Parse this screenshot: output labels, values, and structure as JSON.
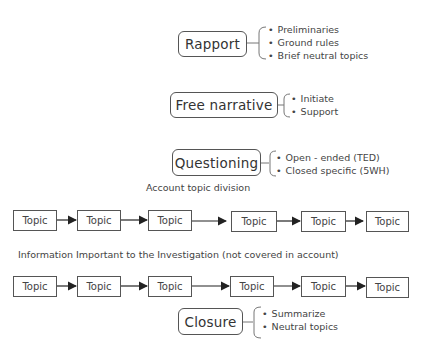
{
  "stages": [
    {
      "label": "Rapport",
      "items": [
        "Preliminaries",
        "Ground rules",
        "Brief neutral topics"
      ]
    },
    {
      "label": "Free narrative",
      "items": [
        "Initiate",
        "Support"
      ]
    },
    {
      "label": "Questioning",
      "items": [
        "Open - ended (TED)",
        "Closed specific (5WH)"
      ]
    },
    {
      "label": "Closure",
      "items": [
        "Summarize",
        "Neutral topics"
      ]
    }
  ],
  "rows": [
    {
      "caption": "Account topic division",
      "topics": [
        "Topic",
        "Topic",
        "Topic",
        "Topic",
        "Topic",
        "Topic"
      ]
    },
    {
      "caption": "Information Important to the Investigation (not covered in account)",
      "topics": [
        "Topic",
        "Topic",
        "Topic",
        "Topic",
        "Topic",
        "Topic"
      ]
    }
  ],
  "colors": {
    "line": "#555555",
    "text": "#444444",
    "background": "#ffffff"
  }
}
